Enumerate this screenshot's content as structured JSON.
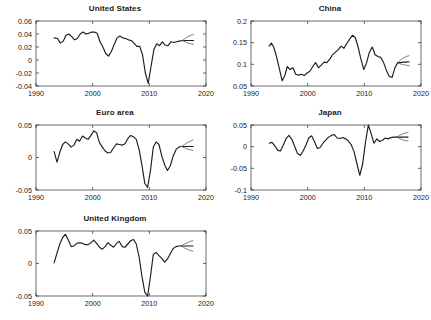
{
  "figure": {
    "panel_titles": {
      "us": "United States",
      "china": "China",
      "euro": "Euro area",
      "japan": "Japan",
      "uk": "United Kingdom"
    }
  },
  "chart_data": [
    {
      "id": "us",
      "type": "line",
      "title": "United States",
      "xlabel": "",
      "ylabel": "",
      "xlim": [
        1990,
        2020
      ],
      "ylim": [
        -0.04,
        0.06
      ],
      "xticks": [
        1990,
        2000,
        2010,
        2020
      ],
      "xtick_labels": [
        "1990",
        "2000",
        "2010",
        "2020"
      ],
      "yticks": [
        -0.04,
        -0.02,
        0,
        0.02,
        0.04,
        0.06
      ],
      "ytick_labels": [
        "-0.04",
        "-0.02",
        "0",
        "0.02",
        "0.04",
        "0.06"
      ],
      "grid": false,
      "legend": null,
      "series": [
        {
          "name": "history",
          "style": "solid-black",
          "x": [
            1993.2,
            1993.8,
            1994.3,
            1994.8,
            1995.3,
            1995.8,
            1996.3,
            1996.8,
            1997.3,
            1997.8,
            1998.3,
            1998.8,
            1999.3,
            1999.8,
            2000.3,
            2000.8,
            2001.3,
            2001.8,
            2002.3,
            2002.8,
            2003.3,
            2003.8,
            2004.3,
            2004.8,
            2005.3,
            2005.8,
            2006.3,
            2006.8,
            2007.3,
            2007.8,
            2008.3,
            2008.8,
            2009.3,
            2009.8,
            2010.3,
            2010.8,
            2011.3,
            2011.8,
            2012.3,
            2012.8,
            2013.3,
            2013.8,
            2014.3,
            2014.8,
            2015.3,
            2015.8
          ],
          "y": [
            0.034,
            0.033,
            0.026,
            0.029,
            0.038,
            0.04,
            0.036,
            0.031,
            0.033,
            0.04,
            0.043,
            0.04,
            0.041,
            0.043,
            0.043,
            0.041,
            0.028,
            0.02,
            0.01,
            0.006,
            0.013,
            0.024,
            0.034,
            0.037,
            0.034,
            0.033,
            0.031,
            0.03,
            0.026,
            0.021,
            0.021,
            0.008,
            -0.02,
            -0.036,
            -0.01,
            0.016,
            0.025,
            0.022,
            0.028,
            0.023,
            0.022,
            0.028,
            0.027,
            0.028,
            0.029,
            0.03
          ]
        },
        {
          "name": "forecast-central",
          "style": "solid-black",
          "x": [
            2015.8,
            2016.3,
            2016.8,
            2017.3,
            2017.8
          ],
          "y": [
            0.03,
            0.03,
            0.03,
            0.03,
            0.03
          ]
        },
        {
          "name": "forecast-upper",
          "style": "thin-grey",
          "x": [
            2015.8,
            2016.3,
            2016.8,
            2017.3,
            2017.8
          ],
          "y": [
            0.03,
            0.033,
            0.036,
            0.038,
            0.039
          ]
        },
        {
          "name": "forecast-lower",
          "style": "thin-grey",
          "x": [
            2015.8,
            2016.3,
            2016.8,
            2017.3,
            2017.8
          ],
          "y": [
            0.03,
            0.028,
            0.026,
            0.025,
            0.024
          ]
        }
      ]
    },
    {
      "id": "china",
      "type": "line",
      "title": "China",
      "xlabel": "",
      "ylabel": "",
      "xlim": [
        1990,
        2020
      ],
      "ylim": [
        0.05,
        0.2
      ],
      "xticks": [
        1990,
        2000,
        2010,
        2020
      ],
      "xtick_labels": [
        "1990",
        "2000",
        "2010",
        "2020"
      ],
      "yticks": [
        0.05,
        0.1,
        0.15,
        0.2
      ],
      "ytick_labels": [
        "0.05",
        "0.1",
        "0.15",
        "0.2"
      ],
      "grid": false,
      "legend": null,
      "series": [
        {
          "name": "history",
          "style": "solid-black",
          "x": [
            1993.2,
            1993.6,
            1994.0,
            1994.5,
            1995.0,
            1995.5,
            1996.0,
            1996.4,
            1996.9,
            1997.4,
            1997.9,
            1998.4,
            1998.9,
            1999.4,
            1999.9,
            2000.4,
            2000.9,
            2001.4,
            2001.9,
            2002.4,
            2002.9,
            2003.4,
            2003.9,
            2004.4,
            2004.9,
            2005.4,
            2005.9,
            2006.4,
            2006.9,
            2007.4,
            2007.9,
            2008.4,
            2008.9,
            2009.4,
            2009.9,
            2010.4,
            2010.9,
            2011.4,
            2011.9,
            2012.4,
            2012.9,
            2013.4,
            2013.9,
            2014.4,
            2014.9,
            2015.4,
            2015.9
          ],
          "y": [
            0.142,
            0.149,
            0.14,
            0.118,
            0.09,
            0.062,
            0.075,
            0.095,
            0.088,
            0.092,
            0.077,
            0.075,
            0.077,
            0.074,
            0.08,
            0.084,
            0.095,
            0.104,
            0.092,
            0.098,
            0.105,
            0.104,
            0.112,
            0.122,
            0.128,
            0.134,
            0.142,
            0.137,
            0.148,
            0.158,
            0.167,
            0.162,
            0.14,
            0.112,
            0.088,
            0.104,
            0.128,
            0.14,
            0.122,
            0.118,
            0.116,
            0.104,
            0.086,
            0.072,
            0.07,
            0.092,
            0.104
          ]
        },
        {
          "name": "forecast-central",
          "style": "solid-black",
          "x": [
            2015.9,
            2016.4,
            2016.9,
            2017.4,
            2017.9
          ],
          "y": [
            0.104,
            0.104,
            0.105,
            0.105,
            0.106
          ]
        },
        {
          "name": "forecast-upper",
          "style": "thin-grey",
          "x": [
            2015.9,
            2016.4,
            2016.9,
            2017.4,
            2017.9
          ],
          "y": [
            0.104,
            0.11,
            0.115,
            0.118,
            0.12
          ]
        },
        {
          "name": "forecast-lower",
          "style": "thin-grey",
          "x": [
            2015.9,
            2016.4,
            2016.9,
            2017.4,
            2017.9
          ],
          "y": [
            0.104,
            0.101,
            0.099,
            0.098,
            0.097
          ]
        }
      ]
    },
    {
      "id": "euro",
      "type": "line",
      "title": "Euro area",
      "xlabel": "",
      "ylabel": "",
      "xlim": [
        1990,
        2020
      ],
      "ylim": [
        -0.05,
        0.05
      ],
      "xticks": [
        1990,
        2000,
        2010,
        2020
      ],
      "xtick_labels": [
        "1990",
        "2000",
        "2010",
        "2020"
      ],
      "yticks": [
        -0.05,
        0,
        0.05
      ],
      "ytick_labels": [
        "-0.05",
        "0",
        "0.05"
      ],
      "grid": false,
      "legend": null,
      "series": [
        {
          "name": "history",
          "style": "solid-black",
          "x": [
            1993.2,
            1993.7,
            1994.2,
            1994.7,
            1995.2,
            1995.7,
            1996.2,
            1996.7,
            1997.2,
            1997.7,
            1998.2,
            1998.7,
            1999.2,
            1999.7,
            2000.2,
            2000.7,
            2001.2,
            2001.7,
            2002.2,
            2002.7,
            2003.2,
            2003.7,
            2004.2,
            2004.7,
            2005.2,
            2005.7,
            2006.2,
            2006.7,
            2007.2,
            2007.7,
            2008.2,
            2008.7,
            2009.2,
            2009.7,
            2010.2,
            2010.7,
            2011.2,
            2011.7,
            2012.2,
            2012.7,
            2013.2,
            2013.7,
            2014.2,
            2014.7,
            2015.2,
            2015.7
          ],
          "y": [
            0.009,
            -0.007,
            0.008,
            0.02,
            0.024,
            0.021,
            0.016,
            0.019,
            0.028,
            0.025,
            0.033,
            0.03,
            0.028,
            0.034,
            0.041,
            0.038,
            0.023,
            0.016,
            0.01,
            0.007,
            0.008,
            0.015,
            0.021,
            0.02,
            0.019,
            0.021,
            0.029,
            0.034,
            0.032,
            0.028,
            0.012,
            -0.012,
            -0.04,
            -0.046,
            -0.02,
            0.016,
            0.024,
            0.02,
            0.002,
            -0.011,
            -0.02,
            -0.013,
            0.002,
            0.012,
            0.016,
            0.017
          ]
        },
        {
          "name": "forecast-central",
          "style": "solid-black",
          "x": [
            2015.7,
            2016.2,
            2016.7,
            2017.2,
            2017.7
          ],
          "y": [
            0.017,
            0.017,
            0.017,
            0.017,
            0.017
          ]
        },
        {
          "name": "forecast-upper",
          "style": "thin-grey",
          "x": [
            2015.7,
            2016.2,
            2016.7,
            2017.2,
            2017.7
          ],
          "y": [
            0.017,
            0.02,
            0.023,
            0.025,
            0.027
          ]
        },
        {
          "name": "forecast-lower",
          "style": "thin-grey",
          "x": [
            2015.7,
            2016.2,
            2016.7,
            2017.2,
            2017.7
          ],
          "y": [
            0.017,
            0.015,
            0.013,
            0.012,
            0.011
          ]
        }
      ]
    },
    {
      "id": "japan",
      "type": "line",
      "title": "Japan",
      "xlabel": "",
      "ylabel": "",
      "xlim": [
        1990,
        2020
      ],
      "ylim": [
        -0.1,
        0.05
      ],
      "xticks": [
        1990,
        2000,
        2010,
        2020
      ],
      "xtick_labels": [
        "1990",
        "2000",
        "2010",
        "2020"
      ],
      "yticks": [
        -0.1,
        -0.05,
        0,
        0.05
      ],
      "ytick_labels": [
        "-0.1",
        "-0.05",
        "0",
        "0.05"
      ],
      "grid": false,
      "legend": null,
      "series": [
        {
          "name": "history",
          "style": "solid-black",
          "x": [
            1993.2,
            1993.7,
            1994.2,
            1994.7,
            1995.2,
            1995.7,
            1996.2,
            1996.7,
            1997.2,
            1997.7,
            1998.2,
            1998.7,
            1999.2,
            1999.7,
            2000.2,
            2000.7,
            2001.2,
            2001.7,
            2002.2,
            2002.7,
            2003.2,
            2003.7,
            2004.2,
            2004.7,
            2005.2,
            2005.7,
            2006.2,
            2006.7,
            2007.2,
            2007.7,
            2008.2,
            2008.7,
            2009.2,
            2009.7,
            2010.2,
            2010.7,
            2011.2,
            2011.7,
            2012.2,
            2012.7,
            2013.2,
            2013.7,
            2014.2,
            2014.7,
            2015.2,
            2015.7
          ],
          "y": [
            0.008,
            0.01,
            0.002,
            -0.008,
            -0.01,
            0.004,
            0.019,
            0.026,
            0.017,
            0.001,
            -0.016,
            -0.02,
            -0.01,
            0.004,
            0.02,
            0.025,
            0.012,
            -0.004,
            -0.002,
            0.008,
            0.015,
            0.022,
            0.026,
            0.028,
            0.02,
            0.019,
            0.021,
            0.018,
            0.013,
            0.004,
            -0.012,
            -0.04,
            -0.066,
            -0.04,
            0.01,
            0.05,
            0.03,
            0.008,
            0.018,
            0.012,
            0.015,
            0.02,
            0.018,
            0.021,
            0.022,
            0.022
          ]
        },
        {
          "name": "forecast-central",
          "style": "solid-black",
          "x": [
            2015.7,
            2016.2,
            2016.7,
            2017.2,
            2017.7
          ],
          "y": [
            0.022,
            0.022,
            0.022,
            0.022,
            0.022
          ]
        },
        {
          "name": "forecast-upper",
          "style": "thin-grey",
          "x": [
            2015.7,
            2016.2,
            2016.7,
            2017.2,
            2017.7
          ],
          "y": [
            0.022,
            0.026,
            0.029,
            0.031,
            0.033
          ]
        },
        {
          "name": "forecast-lower",
          "style": "thin-grey",
          "x": [
            2015.7,
            2016.2,
            2016.7,
            2017.2,
            2017.7
          ],
          "y": [
            0.022,
            0.019,
            0.016,
            0.014,
            0.013
          ]
        }
      ]
    },
    {
      "id": "uk",
      "type": "line",
      "title": "United Kingdom",
      "xlabel": "",
      "ylabel": "",
      "xlim": [
        1990,
        2020
      ],
      "ylim": [
        -0.05,
        0.05
      ],
      "xticks": [
        1990,
        2000,
        2010,
        2020
      ],
      "xtick_labels": [
        "1990",
        "2000",
        "2010",
        "2020"
      ],
      "yticks": [
        -0.05,
        0,
        0.05
      ],
      "ytick_labels": [
        "-0.05",
        "0",
        "0.05"
      ],
      "grid": false,
      "legend": null,
      "series": [
        {
          "name": "history",
          "style": "solid-black",
          "x": [
            1993.2,
            1993.7,
            1994.2,
            1994.7,
            1995.2,
            1995.7,
            1996.2,
            1996.7,
            1997.2,
            1997.7,
            1998.2,
            1998.7,
            1999.2,
            1999.7,
            2000.2,
            2000.7,
            2001.2,
            2001.7,
            2002.2,
            2002.7,
            2003.2,
            2003.7,
            2004.2,
            2004.7,
            2005.2,
            2005.7,
            2006.2,
            2006.7,
            2007.2,
            2007.7,
            2008.2,
            2008.7,
            2009.2,
            2009.7,
            2010.2,
            2010.7,
            2011.2,
            2011.7,
            2012.2,
            2012.7,
            2013.2,
            2013.7,
            2014.2,
            2014.7,
            2015.2,
            2015.7
          ],
          "y": [
            0.001,
            0.016,
            0.03,
            0.04,
            0.045,
            0.036,
            0.026,
            0.027,
            0.031,
            0.032,
            0.031,
            0.029,
            0.029,
            0.032,
            0.036,
            0.031,
            0.025,
            0.022,
            0.026,
            0.032,
            0.028,
            0.025,
            0.031,
            0.034,
            0.026,
            0.025,
            0.03,
            0.035,
            0.037,
            0.03,
            0.01,
            -0.02,
            -0.044,
            -0.05,
            -0.02,
            0.014,
            0.017,
            0.012,
            0.008,
            0.002,
            0.007,
            0.015,
            0.023,
            0.026,
            0.027,
            0.027
          ]
        },
        {
          "name": "forecast-central",
          "style": "solid-black",
          "x": [
            2015.7,
            2016.2,
            2016.7,
            2017.2,
            2017.7
          ],
          "y": [
            0.027,
            0.027,
            0.027,
            0.027,
            0.027
          ]
        },
        {
          "name": "forecast-upper",
          "style": "thin-grey",
          "x": [
            2015.7,
            2016.2,
            2016.7,
            2017.2,
            2017.7
          ],
          "y": [
            0.027,
            0.03,
            0.032,
            0.034,
            0.035
          ]
        },
        {
          "name": "forecast-lower",
          "style": "thin-grey",
          "x": [
            2015.7,
            2016.2,
            2016.7,
            2017.2,
            2017.7
          ],
          "y": [
            0.027,
            0.024,
            0.022,
            0.02,
            0.019
          ]
        }
      ]
    }
  ]
}
